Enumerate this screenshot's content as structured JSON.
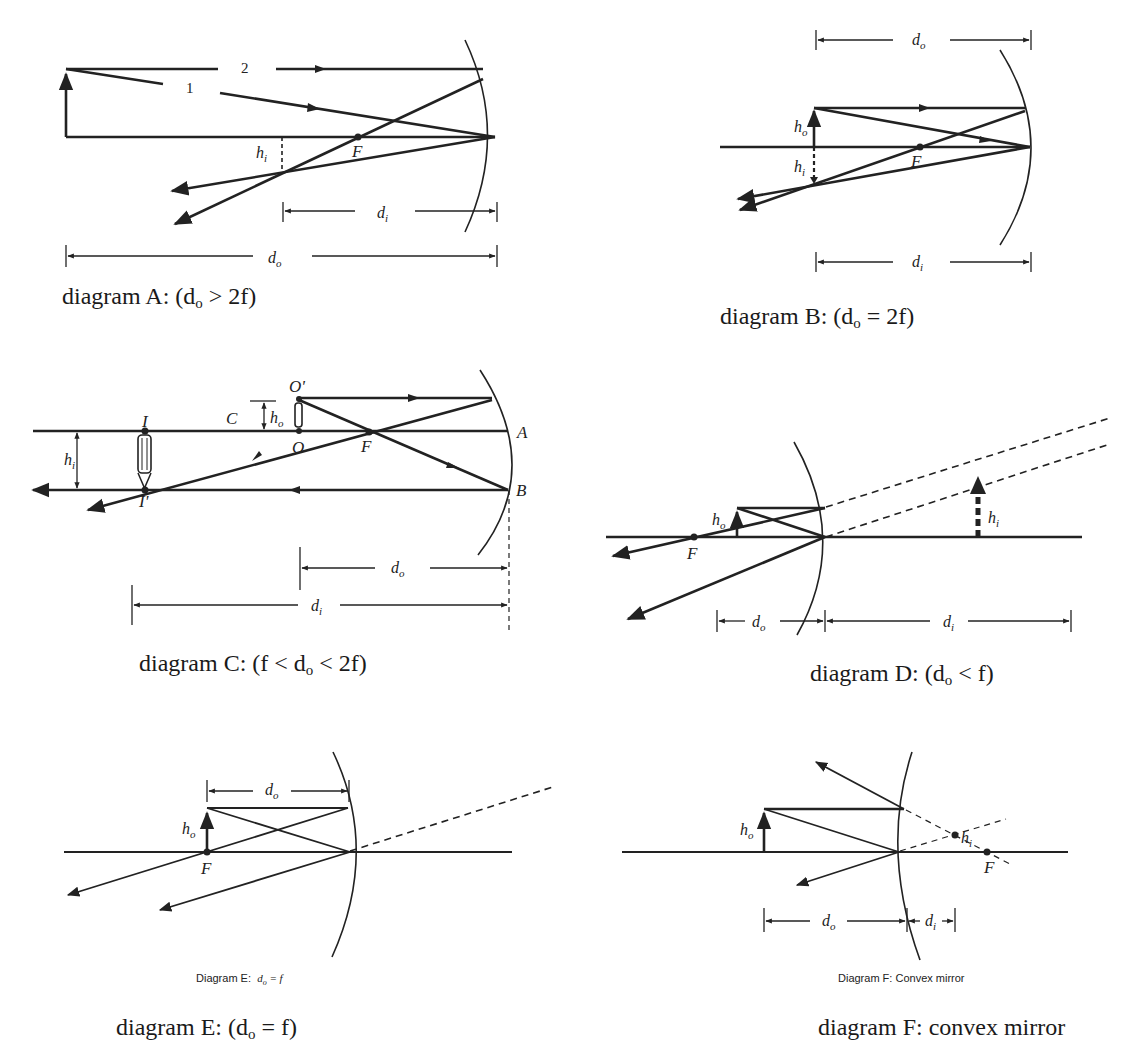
{
  "diagrams": [
    {
      "id": "A",
      "caption_prefix": "diagram A: (d",
      "caption_sub": "o",
      "caption_suffix": " > 2f)",
      "labels": {
        "ray1": "1",
        "ray2": "2",
        "focus": "F",
        "image_height": "h",
        "image_height_sub": "i",
        "image_dist": "d",
        "image_dist_sub": "i",
        "object_dist": "d",
        "object_dist_sub": "o"
      }
    },
    {
      "id": "B",
      "caption_prefix": "diagram B: (d",
      "caption_sub": "o",
      "caption_suffix": " =  2f)",
      "labels": {
        "focus": "F",
        "object_height": "h",
        "object_height_sub": "o",
        "image_height": "h",
        "image_height_sub": "i",
        "object_dist": "d",
        "object_dist_sub": "o",
        "image_dist": "d",
        "image_dist_sub": "i"
      }
    },
    {
      "id": "C",
      "caption_prefix": "diagram C: (f < d",
      "caption_sub": "o",
      "caption_suffix": " < 2f)",
      "labels": {
        "object_top": "O'",
        "object_base": "O",
        "center": "C",
        "focus": "F",
        "image_top": "I",
        "image_tip": "I'",
        "point_a": "A",
        "point_b": "B",
        "object_height": "h",
        "object_height_sub": "o",
        "image_height": "h",
        "image_height_sub": "i",
        "object_dist": "d",
        "object_dist_sub": "o",
        "image_dist": "d",
        "image_dist_sub": "i"
      }
    },
    {
      "id": "D",
      "caption_prefix": "diagram D: (d",
      "caption_sub": "o",
      "caption_suffix": " < f)",
      "labels": {
        "focus": "F",
        "object_height": "h",
        "object_height_sub": "o",
        "image_height": "h",
        "image_height_sub": "i",
        "object_dist": "d",
        "object_dist_sub": "o",
        "image_dist": "d",
        "image_dist_sub": "i"
      }
    },
    {
      "id": "E",
      "inner_caption_prefix": "Diagram E:",
      "inner_caption_eq": "d",
      "inner_caption_sub": "o",
      "inner_caption_rest": " =  f",
      "caption_prefix": "diagram E: (d",
      "caption_sub": "o",
      "caption_suffix": " = f)",
      "labels": {
        "focus": "F",
        "object_height": "h",
        "object_height_sub": "o",
        "object_dist": "d",
        "object_dist_sub": "o"
      }
    },
    {
      "id": "F",
      "inner_caption": "Diagram F:  Convex mirror",
      "caption_full": "diagram F: convex mirror",
      "labels": {
        "focus": "F",
        "object_height": "h",
        "object_height_sub": "o",
        "image_height": "h",
        "image_height_sub": "i",
        "object_dist": "d",
        "object_dist_sub": "o",
        "image_dist": "d",
        "image_dist_sub": "i"
      }
    }
  ]
}
